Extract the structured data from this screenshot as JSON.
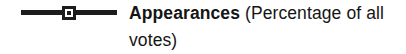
{
  "chart_data": {
    "type": "line",
    "title": "",
    "subtitle": "",
    "xlabel": "",
    "ylabel": "",
    "grid": false,
    "legend_position": "standalone",
    "categories": [],
    "series": [
      {
        "name": "Appearances",
        "unit": "Percentage of all votes",
        "marker": "square-with-center-dot",
        "line_color": "#1c1c1c",
        "values": []
      }
    ],
    "annotations": [
      "Appearances (Percentage of all votes)"
    ]
  },
  "legend": {
    "marker": {
      "icon_name": "line-square-marker-icon",
      "line_color": "#1c1c1c",
      "symbol_fill": "#ffffff",
      "symbol_border": "#1c1c1c",
      "symbol_dot": "#1c1c1c"
    },
    "series_name": "Appearances",
    "qualifier": " (Percentage of all votes)"
  },
  "colors": {
    "background": "#ffffff",
    "text": "#151515",
    "ink": "#1c1c1c"
  }
}
